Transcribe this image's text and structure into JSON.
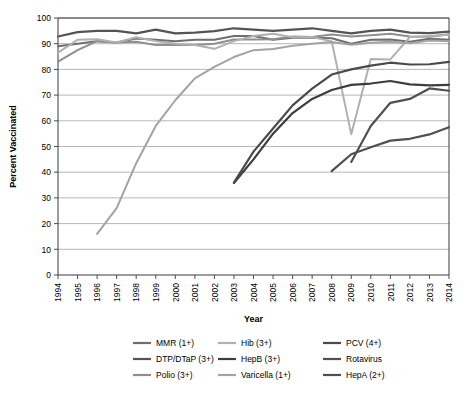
{
  "chart_data": {
    "type": "line",
    "title": "",
    "xlabel": "Year",
    "ylabel": "Percent Vaccinated",
    "xlim": [
      1994,
      2014
    ],
    "ylim": [
      0,
      100
    ],
    "grid": true,
    "legend_position": "bottom",
    "x": [
      1994,
      1995,
      1996,
      1997,
      1998,
      1999,
      2000,
      2001,
      2002,
      2003,
      2004,
      2005,
      2006,
      2007,
      2008,
      2009,
      2010,
      2011,
      2012,
      2013,
      2014
    ],
    "xticklabels": [
      "1994",
      "1995",
      "1996",
      "1997",
      "1998",
      "1999",
      "2000",
      "2001",
      "2002",
      "2003",
      "2004",
      "2005",
      "2006",
      "2007",
      "2008",
      "2009",
      "2010",
      "2011",
      "2012",
      "2013",
      "2014"
    ],
    "yticklabels": [
      "0",
      "10",
      "20",
      "30",
      "40",
      "50",
      "60",
      "70",
      "80",
      "90",
      "100"
    ],
    "yticks": [
      0,
      10,
      20,
      30,
      40,
      50,
      60,
      70,
      80,
      90,
      100
    ],
    "series": [
      {
        "name": "MMR (1+)",
        "color": "#6e6e6e",
        "width": 2.0,
        "x": [
          1994,
          1995,
          1996,
          1997,
          1998,
          1999,
          2000,
          2001,
          2002,
          2003,
          2004,
          2005,
          2006,
          2007,
          2008,
          2009,
          2010,
          2011,
          2012,
          2013,
          2014
        ],
        "values": [
          89.0,
          90.0,
          91.0,
          90.5,
          92.0,
          91.5,
          91.0,
          91.5,
          91.5,
          93.0,
          93.0,
          91.5,
          92.3,
          92.3,
          92.1,
          90.0,
          91.5,
          91.6,
          90.8,
          91.9,
          91.5
        ]
      },
      {
        "name": "DTP/DTaP (3+)",
        "color": "#545454",
        "width": 2.2,
        "x": [
          1994,
          1995,
          1996,
          1997,
          1998,
          1999,
          2000,
          2001,
          2002,
          2003,
          2004,
          2005,
          2006,
          2007,
          2008,
          2009,
          2010,
          2011,
          2012,
          2013,
          2014
        ],
        "values": [
          92.8,
          94.5,
          95.0,
          95.0,
          94.0,
          95.5,
          94.0,
          94.3,
          94.9,
          96.0,
          95.5,
          95.0,
          95.5,
          96.0,
          95.0,
          94.0,
          95.0,
          95.5,
          94.3,
          94.1,
          94.7
        ]
      },
      {
        "name": "Polio (3+)",
        "color": "#8f8f8f",
        "width": 2.0,
        "x": [
          1994,
          1995,
          1996,
          1997,
          1998,
          1999,
          2000,
          2001,
          2002,
          2003,
          2004,
          2005,
          2006,
          2007,
          2008,
          2009,
          2010,
          2011,
          2012,
          2013,
          2014
        ],
        "values": [
          83.0,
          87.5,
          91.0,
          90.5,
          90.8,
          89.5,
          89.5,
          89.5,
          90.0,
          91.6,
          91.6,
          91.7,
          92.8,
          92.6,
          93.6,
          92.8,
          93.3,
          93.9,
          92.8,
          92.7,
          93.7
        ]
      },
      {
        "name": "Hib (3+)",
        "color": "#b0b0b0",
        "width": 2.0,
        "x": [
          1994,
          1995,
          1996,
          1997,
          1998,
          1999,
          2000,
          2001,
          2002,
          2003,
          2004,
          2005,
          2006,
          2007,
          2008,
          2009,
          2010,
          2011,
          2012,
          2013,
          2014
        ],
        "values": [
          86.5,
          91.5,
          91.7,
          90.5,
          92.5,
          91.0,
          90.0,
          89.5,
          88.0,
          91.0,
          93.0,
          93.9,
          92.5,
          92.6,
          90.9,
          54.8,
          84.0,
          83.9,
          92.6,
          93.0,
          93.5
        ]
      },
      {
        "name": "HepB (3+)",
        "color": "#3d3d3d",
        "width": 2.2,
        "x": [
          2003,
          2004,
          2005,
          2006,
          2007,
          2008,
          2009,
          2010,
          2011,
          2012,
          2013,
          2014
        ],
        "values": [
          35.8,
          45.0,
          55.0,
          63.0,
          68.5,
          72.0,
          74.0,
          74.5,
          75.5,
          74.2,
          73.8,
          74.0
        ]
      },
      {
        "name": "Varicella (1+)",
        "color": "#a3a3a3",
        "width": 2.0,
        "x": [
          1996,
          1997,
          1998,
          1999,
          2000,
          2001,
          2002,
          2003,
          2004,
          2005,
          2006,
          2007,
          2008,
          2009,
          2010,
          2011,
          2012,
          2013,
          2014
        ],
        "values": [
          16.0,
          26.0,
          43.5,
          58.0,
          68.0,
          76.5,
          81.0,
          84.8,
          87.5,
          87.9,
          89.2,
          90.0,
          90.7,
          89.6,
          90.4,
          90.8,
          90.2,
          91.2,
          91.0
        ]
      },
      {
        "name": "PCV (4+)",
        "color": "#4a4a4a",
        "width": 2.2,
        "x": [
          2003,
          2004,
          2005,
          2006,
          2007,
          2008,
          2009,
          2010,
          2011,
          2012,
          2013,
          2014
        ],
        "values": [
          36.0,
          48.0,
          57.0,
          66.0,
          72.5,
          78.0,
          80.0,
          81.5,
          82.6,
          81.9,
          82.0,
          82.9
        ]
      },
      {
        "name": "Rotavirus",
        "color": "#505050",
        "width": 2.2,
        "x": [
          2009,
          2010,
          2011,
          2012,
          2013,
          2014
        ],
        "values": [
          44.0,
          58.0,
          67.0,
          68.5,
          72.6,
          71.7
        ]
      },
      {
        "name": "HepA (2+)",
        "color": "#4f4f4f",
        "width": 2.2,
        "x": [
          2008,
          2009,
          2010,
          2011,
          2012,
          2013,
          2014
        ],
        "values": [
          40.4,
          47.0,
          49.7,
          52.3,
          53.0,
          54.7,
          57.5
        ]
      }
    ],
    "legend": [
      {
        "name": "MMR (1+)",
        "color": "#6e6e6e"
      },
      {
        "name": "Hib (3+)",
        "color": "#b0b0b0"
      },
      {
        "name": "PCV (4+)",
        "color": "#4a4a4a"
      },
      {
        "name": "DTP/DTaP (3+)",
        "color": "#545454"
      },
      {
        "name": "HepB (3+)",
        "color": "#3d3d3d"
      },
      {
        "name": "Rotavirus",
        "color": "#505050"
      },
      {
        "name": "Polio (3+)",
        "color": "#8f8f8f"
      },
      {
        "name": "Varicella (1+)",
        "color": "#a3a3a3"
      },
      {
        "name": "HepA (2+)",
        "color": "#4f4f4f"
      }
    ]
  }
}
